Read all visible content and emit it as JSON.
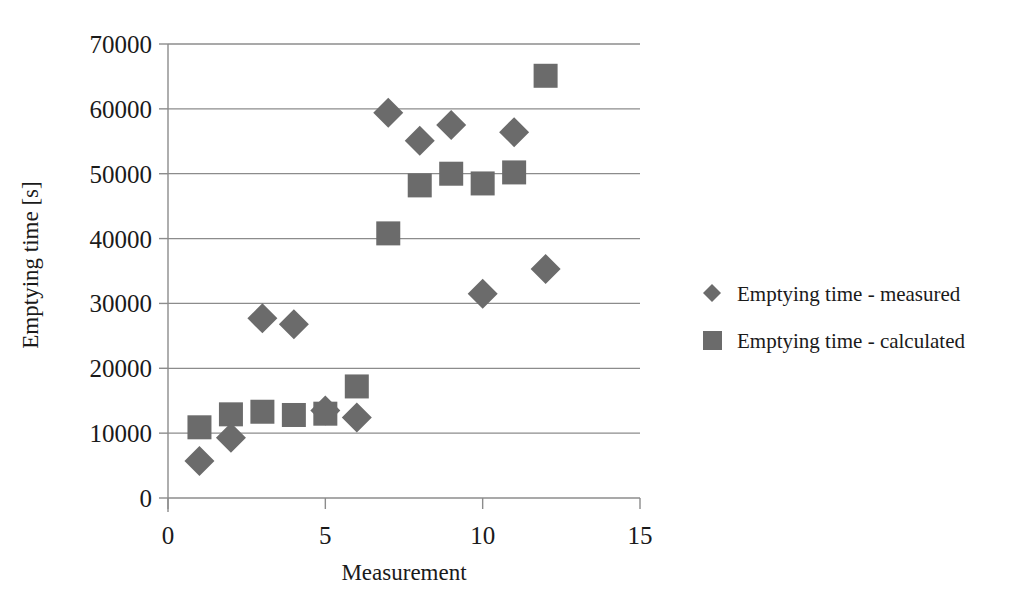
{
  "chart_data": {
    "type": "scatter",
    "title": "",
    "xlabel": "Measurement",
    "ylabel": "Emptying time  [s]",
    "xlim": [
      0,
      15
    ],
    "ylim": [
      0,
      70000
    ],
    "xticks": [
      "0",
      "5",
      "10",
      "15"
    ],
    "xtick_values": [
      0,
      5,
      10,
      15
    ],
    "yticks": [
      "0",
      "10000",
      "20000",
      "30000",
      "40000",
      "50000",
      "60000",
      "70000"
    ],
    "ytick_values": [
      0,
      10000,
      20000,
      30000,
      40000,
      50000,
      60000,
      70000
    ],
    "grid": true,
    "legend_position": "right",
    "x": [
      1,
      2,
      3,
      4,
      5,
      6,
      7,
      8,
      9,
      10,
      11,
      12
    ],
    "series": [
      {
        "name": "Emptying time - measured",
        "marker": "diamond",
        "color": "#6b6b6b",
        "values": [
          5700,
          9300,
          27700,
          26800,
          13500,
          12400,
          59400,
          55100,
          57500,
          31500,
          56400,
          35300
        ]
      },
      {
        "name": "Emptying time - calculated",
        "marker": "square",
        "color": "#6b6b6b",
        "values": [
          10900,
          12900,
          13300,
          12800,
          13000,
          17200,
          40800,
          48200,
          50000,
          48500,
          50200,
          65100
        ]
      }
    ]
  },
  "legend": {
    "items": [
      {
        "label": "Emptying time - measured",
        "marker": "diamond-marker-icon"
      },
      {
        "label": "Emptying time - calculated",
        "marker": "square-marker-icon"
      }
    ]
  }
}
